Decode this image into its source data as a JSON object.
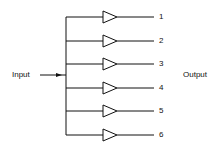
{
  "diagram": {
    "input_label": "Input",
    "output_label": "Output",
    "outputs": [
      {
        "label": "1",
        "y": 17
      },
      {
        "label": "2",
        "y": 41
      },
      {
        "label": "3",
        "y": 64
      },
      {
        "label": "4",
        "y": 88
      },
      {
        "label": "5",
        "y": 111
      },
      {
        "label": "6",
        "y": 135
      }
    ],
    "colors": {
      "line": "#111111",
      "background": "#ffffff"
    }
  }
}
